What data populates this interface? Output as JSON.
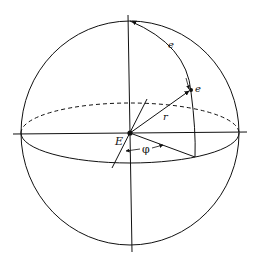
{
  "diagram": {
    "type": "celestial-sphere",
    "labels": {
      "center": "E",
      "radius": "r",
      "arc": "e",
      "point": "e",
      "angle": "φ"
    },
    "colors": {
      "stroke": "#111111",
      "background": "#ffffff"
    }
  }
}
